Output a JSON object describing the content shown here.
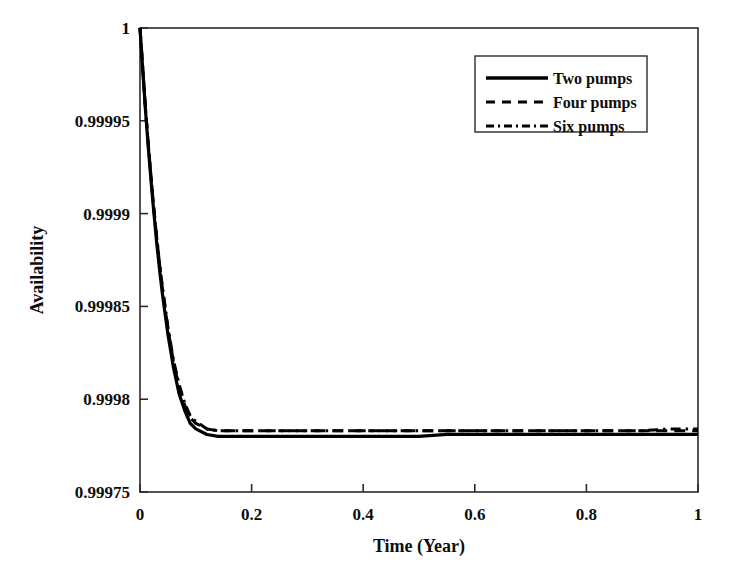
{
  "chart_data": {
    "type": "line",
    "title": "",
    "xlabel": "Time (Year)",
    "ylabel": "Availability",
    "xlim": [
      0,
      1
    ],
    "ylim": [
      0.99975,
      1
    ],
    "grid": false,
    "legend_position": "upper-right",
    "x_tick_labels": [
      "0",
      "0.2",
      "0.4",
      "0.6",
      "0.8",
      "1"
    ],
    "x_tick_values": [
      0,
      0.2,
      0.4,
      0.6,
      0.8,
      1
    ],
    "y_tick_labels": [
      "1",
      "0.99995",
      "0.9999",
      "0.99985",
      "0.9998",
      "0.99975"
    ],
    "y_tick_values": [
      1,
      0.99995,
      0.9999,
      0.99985,
      0.9998,
      0.99975
    ],
    "series": [
      {
        "name": "Two pumps",
        "dash": "solid",
        "color": "#000000",
        "x": [
          0,
          0.005,
          0.01,
          0.015,
          0.02,
          0.025,
          0.03,
          0.035,
          0.04,
          0.05,
          0.06,
          0.07,
          0.08,
          0.09,
          0.1,
          0.12,
          0.14,
          0.16,
          0.18,
          0.2,
          0.25,
          0.3,
          0.35,
          0.4,
          0.45,
          0.5,
          0.55,
          0.6,
          0.65,
          0.7,
          0.75,
          0.8,
          0.85,
          0.9,
          0.95,
          1
        ],
        "y": [
          1.0,
          0.999977,
          0.999955,
          0.999935,
          0.999917,
          0.9999,
          0.999884,
          0.99987,
          0.999857,
          0.999835,
          0.999817,
          0.999803,
          0.999794,
          0.999787,
          0.999784,
          0.999781,
          0.99978,
          0.99978,
          0.99978,
          0.99978,
          0.99978,
          0.99978,
          0.99978,
          0.99978,
          0.99978,
          0.99978,
          0.999781,
          0.999781,
          0.999781,
          0.999781,
          0.999781,
          0.999781,
          0.999781,
          0.999781,
          0.999781,
          0.999781
        ]
      },
      {
        "name": "Four pumps",
        "dash": "dashed",
        "color": "#000000",
        "x": [
          0,
          0.005,
          0.01,
          0.015,
          0.02,
          0.025,
          0.03,
          0.035,
          0.04,
          0.05,
          0.06,
          0.07,
          0.08,
          0.09,
          0.1,
          0.12,
          0.14,
          0.16,
          0.18,
          0.2,
          0.25,
          0.3,
          0.35,
          0.4,
          0.45,
          0.5,
          0.55,
          0.6,
          0.65,
          0.7,
          0.75,
          0.8,
          0.85,
          0.9,
          0.95,
          1
        ],
        "y": [
          1.0,
          0.999978,
          0.999956,
          0.999937,
          0.999919,
          0.999902,
          0.999887,
          0.999873,
          0.99986,
          0.999838,
          0.99982,
          0.999807,
          0.999797,
          0.99979,
          0.999787,
          0.999784,
          0.999783,
          0.999783,
          0.999783,
          0.999783,
          0.999783,
          0.999783,
          0.999783,
          0.999783,
          0.999783,
          0.999783,
          0.999783,
          0.999783,
          0.999783,
          0.999783,
          0.999783,
          0.999783,
          0.999783,
          0.999783,
          0.999783,
          0.999783
        ]
      },
      {
        "name": "Six pumps",
        "dash": "dashdot",
        "color": "#000000",
        "x": [
          0,
          0.005,
          0.01,
          0.015,
          0.02,
          0.025,
          0.03,
          0.035,
          0.04,
          0.05,
          0.06,
          0.07,
          0.08,
          0.09,
          0.1,
          0.12,
          0.14,
          0.16,
          0.18,
          0.2,
          0.25,
          0.3,
          0.35,
          0.4,
          0.45,
          0.5,
          0.55,
          0.6,
          0.65,
          0.7,
          0.75,
          0.8,
          0.85,
          0.9,
          0.95,
          1
        ],
        "y": [
          1.0,
          0.999978,
          0.999956,
          0.999937,
          0.999919,
          0.999902,
          0.999887,
          0.999873,
          0.999861,
          0.999839,
          0.999821,
          0.999808,
          0.999798,
          0.999791,
          0.999788,
          0.999784,
          0.999783,
          0.999783,
          0.999783,
          0.999783,
          0.999783,
          0.999783,
          0.999783,
          0.999783,
          0.999783,
          0.999783,
          0.999783,
          0.999783,
          0.999783,
          0.999783,
          0.999783,
          0.999783,
          0.999783,
          0.999783,
          0.999784,
          0.999784
        ]
      }
    ]
  },
  "axes": {
    "x_title": "Time (Year)",
    "y_title": "Availability"
  },
  "legend": {
    "entries": [
      {
        "label": "Two pumps",
        "style": "solid"
      },
      {
        "label": "Four pumps",
        "style": "dashed"
      },
      {
        "label": "Six pumps",
        "style": "dashdot"
      }
    ]
  },
  "colors": {
    "line": "#000000",
    "frame": "#2b2b2b",
    "text": "#0d0d0d",
    "background": "#ffffff"
  }
}
